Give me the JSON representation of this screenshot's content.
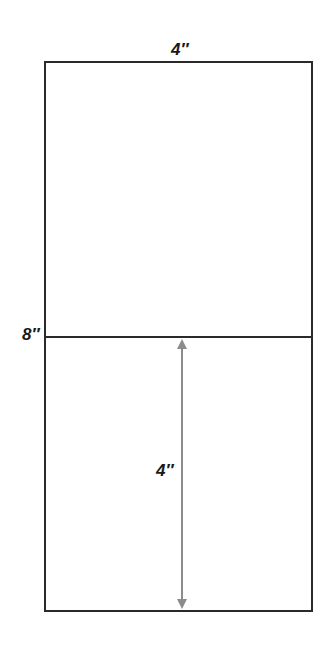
{
  "diagram": {
    "type": "dimensioned-rectangle",
    "labels": {
      "top_width": "4″",
      "left_mark": "8″",
      "inner_height": "4″"
    },
    "colors": {
      "outline": "#2a2a2a",
      "arrow": "#8c8c8c",
      "background": "#ffffff"
    },
    "shapes": {
      "outer_rect": {
        "x": 45,
        "y": 62,
        "w": 267,
        "h": 549
      },
      "divider_y": 337,
      "arrow": {
        "x": 182,
        "y1": 339,
        "y2": 609
      }
    }
  }
}
